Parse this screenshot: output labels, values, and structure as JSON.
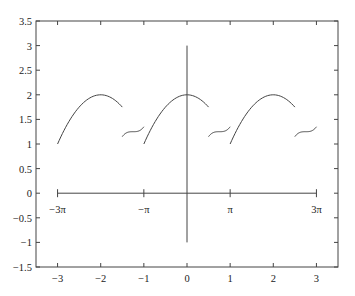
{
  "chart_data": {
    "type": "line",
    "title": "",
    "xlabel": "",
    "ylabel": "",
    "xlim": [
      -3.5,
      3.5
    ],
    "ylim": [
      -1.5,
      3.5
    ],
    "grid": false,
    "legend": null,
    "x_ticks": [
      -3,
      -2,
      -1,
      0,
      1,
      2,
      3
    ],
    "x_tick_labels": [
      "-3",
      "-2",
      "-1",
      "0",
      "1",
      "2",
      "3"
    ],
    "y_ticks": [
      -1.5,
      -1,
      -0.5,
      0,
      0.5,
      1,
      1.5,
      2,
      2.5,
      3,
      3.5
    ],
    "y_tick_labels": [
      "-1.5",
      "-1",
      "-0.5",
      "0",
      "0.5",
      "1",
      "1.5",
      "2",
      "2.5",
      "3",
      "3.5"
    ],
    "series": [
      {
        "name": "arc-1",
        "x": [
          -3,
          -2.5,
          -2,
          -1.75,
          -1.5
        ],
        "y": [
          1,
          1.75,
          2,
          1.94,
          1.75
        ]
      },
      {
        "name": "wiggle-1",
        "x": [
          -1.5,
          -1.375,
          -1.25,
          -1.125,
          -1
        ],
        "y": [
          1.15,
          1.23,
          1.25,
          1.27,
          1.35
        ]
      },
      {
        "name": "arc-2",
        "x": [
          -1,
          -0.5,
          0,
          0.25,
          0.5
        ],
        "y": [
          1,
          1.75,
          2,
          1.94,
          1.75
        ]
      },
      {
        "name": "wiggle-2",
        "x": [
          0.5,
          0.625,
          0.75,
          0.875,
          1
        ],
        "y": [
          1.15,
          1.23,
          1.25,
          1.27,
          1.35
        ]
      },
      {
        "name": "arc-3",
        "x": [
          1,
          1.5,
          2,
          2.25,
          2.5
        ],
        "y": [
          1,
          1.75,
          2,
          1.94,
          1.75
        ]
      },
      {
        "name": "wiggle-3",
        "x": [
          2.5,
          2.625,
          2.75,
          2.875,
          3
        ],
        "y": [
          1.15,
          1.23,
          1.25,
          1.27,
          1.35
        ]
      }
    ],
    "annotations": {
      "vertical_line": {
        "x": 0,
        "y_from": -1,
        "y_to": 3
      },
      "pi_axis": {
        "y": 0,
        "x_from": -3,
        "x_to": 3,
        "ticks": [
          -3,
          -1,
          1,
          3
        ],
        "labels": [
          "−3π",
          "−π",
          "π",
          "3π"
        ]
      }
    }
  }
}
